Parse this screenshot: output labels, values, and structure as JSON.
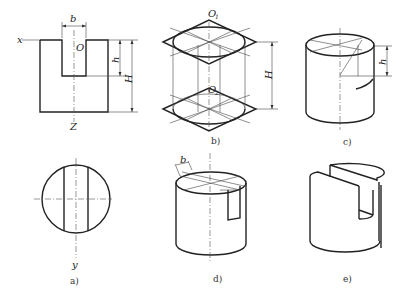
{
  "figure": {
    "panels": [
      {
        "id": "a",
        "caption": "a)",
        "description": "Orthographic front and top views of slotted cylinder"
      },
      {
        "id": "b",
        "caption": "b)",
        "description": "Isometric rhombus construction for top and bottom ellipses"
      },
      {
        "id": "c",
        "caption": "c)",
        "description": "Isometric cylinder with slot depth h marked"
      },
      {
        "id": "d",
        "caption": "d)",
        "description": "Isometric cylinder with slot width b on top face"
      },
      {
        "id": "e",
        "caption": "e)",
        "description": "Finished isometric slotted cylinder"
      }
    ],
    "labels": {
      "b": "b",
      "h": "h",
      "H": "H",
      "O": "O",
      "x": "x",
      "y": "y",
      "Z": "Z",
      "O1": "O",
      "O1_sub": "1",
      "O2": "O",
      "O2_sub": "2"
    }
  }
}
